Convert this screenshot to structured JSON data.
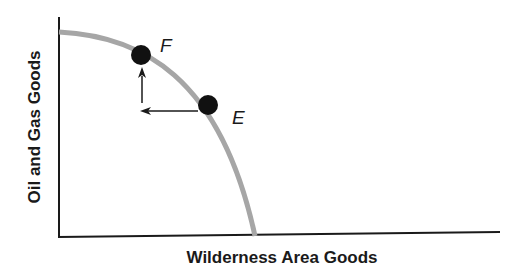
{
  "diagram": {
    "type": "production-possibilities-frontier",
    "x_axis_label": "Wilderness Area Goods",
    "y_axis_label": "Oil and Gas Goods",
    "points": [
      {
        "label": "F",
        "position": "upper-left on curve"
      },
      {
        "label": "E",
        "position": "lower-right on curve"
      }
    ],
    "arrows": [
      "left from E",
      "up to F"
    ],
    "colors": {
      "curve": "#a6a6a6",
      "axis": "#1a1a1a",
      "point": "#111111"
    }
  }
}
